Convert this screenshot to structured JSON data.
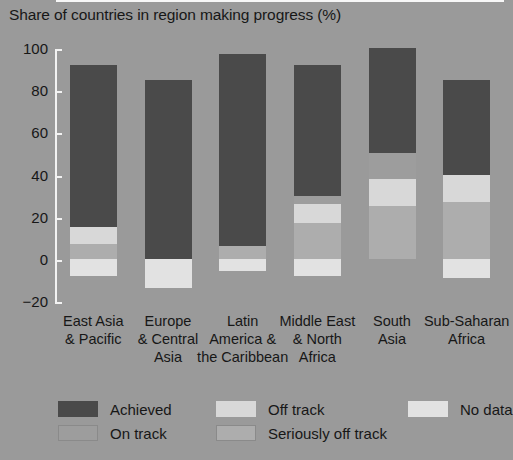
{
  "title": "Share of countries in region making progress (%)",
  "chart_data": {
    "type": "bar",
    "title": "Share of countries in region making progress (%)",
    "xlabel": "",
    "ylabel": "",
    "ylim": [
      -20,
      100
    ],
    "yticks": [
      -20,
      0,
      20,
      40,
      60,
      80,
      100
    ],
    "grid": false,
    "stacked": true,
    "legend_position": "bottom",
    "categories": [
      "East Asia & Pacific",
      "Europe & Central Asia",
      "Latin America & the Caribbean",
      "Middle East & North Africa",
      "South Asia",
      "Sub-Saharan Africa"
    ],
    "series": [
      {
        "name": "Achieved",
        "values": [
          77,
          85,
          91,
          62,
          50,
          45
        ]
      },
      {
        "name": "On track",
        "values": [
          0,
          0,
          0,
          4,
          12,
          0
        ]
      },
      {
        "name": "Off track",
        "values": [
          8,
          0,
          0,
          9,
          13,
          13
        ]
      },
      {
        "name": "Seriously off track",
        "values": [
          7,
          0,
          6,
          17,
          25,
          27
        ]
      },
      {
        "name": "No data",
        "values": [
          -8,
          -14,
          -6,
          -8,
          0,
          -9
        ]
      }
    ],
    "totals_positive": [
      92,
      85,
      97,
      92,
      100,
      85
    ],
    "totals_negative": [
      -8,
      -14,
      -6,
      -8,
      0,
      -9
    ]
  },
  "yaxis": {
    "ticks": [
      {
        "value": 100,
        "label": "100"
      },
      {
        "value": 80,
        "label": "80"
      },
      {
        "value": 60,
        "label": "60"
      },
      {
        "value": 40,
        "label": "40"
      },
      {
        "value": 20,
        "label": "20"
      },
      {
        "value": 0,
        "label": "0"
      },
      {
        "value": -20,
        "label": "−20"
      }
    ]
  },
  "categories": [
    {
      "lines": [
        "East Asia",
        "& Pacific"
      ]
    },
    {
      "lines": [
        "Europe",
        "& Central",
        "Asia"
      ]
    },
    {
      "lines": [
        "Latin",
        "America &",
        "the Caribbean"
      ]
    },
    {
      "lines": [
        "Middle East",
        "& North",
        "Africa"
      ]
    },
    {
      "lines": [
        "South",
        "Asia"
      ]
    },
    {
      "lines": [
        "Sub-Saharan",
        "Africa"
      ]
    }
  ],
  "legend": [
    {
      "label": "Achieved",
      "color": "#4a4a4a"
    },
    {
      "label": "On track",
      "color": "#9d9d9d"
    },
    {
      "label": "Off track",
      "color": "#d8d8d8"
    },
    {
      "label": "Seriously off track",
      "color": "#adadad"
    },
    {
      "label": "No data",
      "color": "#e2e2e2"
    }
  ],
  "colors": {
    "background": "#9a9a9a",
    "axis": "#f2f2f2",
    "text": "#171717",
    "achieved": "#4a4a4a",
    "on_track": "#9d9d9d",
    "off_track": "#d8d8d8",
    "seriously_off_track": "#adadad",
    "no_data": "#e2e2e2"
  }
}
